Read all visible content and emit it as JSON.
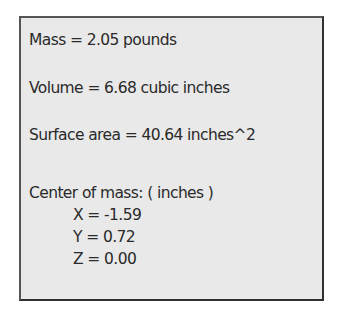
{
  "mass_properties": {
    "mass": "Mass = 2.05 pounds",
    "volume": "Volume = 6.68 cubic inches",
    "surface_area": "Surface area = 40.64 inches^2",
    "center_of_mass": {
      "label": "Center of mass: ( inches )",
      "x": "X = -1.59",
      "y": "Y = 0.72",
      "z": "Z = 0.00"
    }
  }
}
